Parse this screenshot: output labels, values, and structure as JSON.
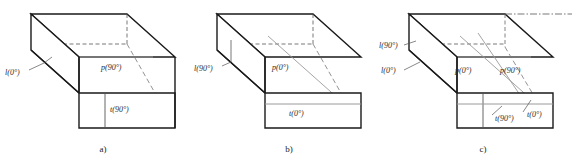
{
  "figure": {
    "type": "technical-line-drawing",
    "background_color": "#ffffff",
    "line_color": "#1a1a1a",
    "hidden_line_color": "#555555",
    "thin_line_color": "#888888",
    "label_color": "#2b2b2b"
  },
  "panels": [
    {
      "id": "a",
      "caption": "a)",
      "labels": [
        {
          "key": "l0",
          "text": "l(0°)"
        },
        {
          "key": "p90",
          "text": "p(90°)"
        },
        {
          "key": "t90",
          "text": "t(90°)"
        }
      ]
    },
    {
      "id": "b",
      "caption": "b)",
      "labels": [
        {
          "key": "l90",
          "text": "l(90°)"
        },
        {
          "key": "p0",
          "text": "p(0°)"
        },
        {
          "key": "t0",
          "text": "t(0°)"
        }
      ]
    },
    {
      "id": "c",
      "caption": "c)",
      "labels": [
        {
          "key": "l90",
          "text": "l(90°)"
        },
        {
          "key": "l0",
          "text": "l(0°)"
        },
        {
          "key": "p0",
          "text": "p(0°)"
        },
        {
          "key": "p90",
          "text": "p(90°)"
        },
        {
          "key": "t90",
          "text": "t(90°)"
        },
        {
          "key": "t0",
          "text": "t(0°)"
        }
      ]
    }
  ]
}
